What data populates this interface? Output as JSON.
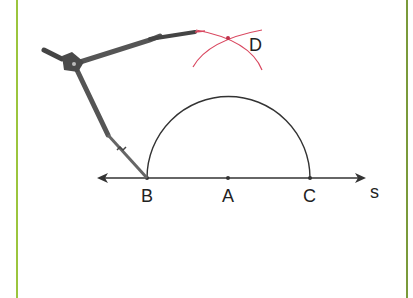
{
  "figure": {
    "border_color": "#9bc53d",
    "arc_color": "#d9475f",
    "line_color": "#333333",
    "points": {
      "B": {
        "label": "B",
        "x": 147,
        "y": 178
      },
      "A": {
        "label": "A",
        "x": 228,
        "y": 178
      },
      "C": {
        "label": "C",
        "x": 310,
        "y": 178
      },
      "D": {
        "label": "D",
        "x": 228,
        "y": 38
      }
    },
    "line_label": "s",
    "tool": "compass-icon"
  }
}
